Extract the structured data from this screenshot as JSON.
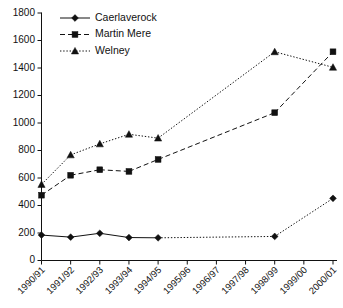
{
  "chart_data": {
    "type": "line",
    "title": "",
    "subtitle": "",
    "xlabel": "",
    "ylabel": "",
    "ylim": [
      0,
      1800
    ],
    "ytick_step": 200,
    "yticks": [
      0,
      200,
      400,
      600,
      800,
      1000,
      1200,
      1400,
      1600,
      1800
    ],
    "grid": false,
    "legend_position": "top-left",
    "categories": [
      "1990/91",
      "1991/92",
      "1992/93",
      "1993/94",
      "1994/95",
      "1995/96",
      "1996/97",
      "1997/98",
      "1998/99",
      "1999/00",
      "2000/01"
    ],
    "series": [
      {
        "name": "Caerlaverock",
        "marker": "diamond",
        "linestyle": "solid",
        "gap_linestyle": "dotted",
        "color": "#111111",
        "values": [
          185,
          170,
          198,
          167,
          165,
          null,
          null,
          null,
          175,
          null,
          452
        ]
      },
      {
        "name": "Martin Mere",
        "marker": "square",
        "linestyle": "dashed",
        "gap_linestyle": "dashed",
        "color": "#111111",
        "values": [
          475,
          620,
          660,
          648,
          735,
          null,
          null,
          null,
          1075,
          null,
          1518
        ]
      },
      {
        "name": "Welney",
        "marker": "triangle",
        "linestyle": "dotted",
        "gap_linestyle": "dotted",
        "color": "#111111",
        "values": [
          553,
          768,
          848,
          918,
          890,
          null,
          null,
          null,
          1518,
          null,
          1405
        ]
      }
    ]
  },
  "legend": {
    "items": [
      {
        "label": "Caerlaverock",
        "marker": "diamond",
        "linestyle": "solid"
      },
      {
        "label": "Martin Mere",
        "marker": "square",
        "linestyle": "dashed"
      },
      {
        "label": "Welney",
        "marker": "triangle",
        "linestyle": "dotted"
      }
    ]
  }
}
